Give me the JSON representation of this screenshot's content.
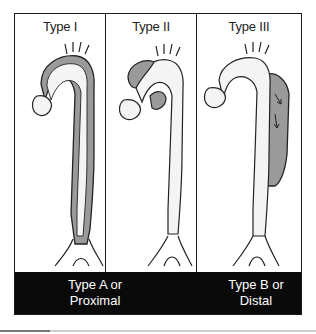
{
  "figure": {
    "panels": [
      {
        "id": "type-1",
        "title": "Type I",
        "dissection_extent": "ascending aorta, arch and descending aorta"
      },
      {
        "id": "type-2",
        "title": "Type II",
        "dissection_extent": "ascending aorta only"
      },
      {
        "id": "type-3",
        "title": "Type III",
        "dissection_extent": "descending aorta only"
      }
    ],
    "classification_labels": [
      {
        "line1": "Type A or",
        "line2": "Proximal",
        "spans": [
          "Type I",
          "Type II"
        ]
      },
      {
        "line1": "Type B or",
        "line2": "Distal",
        "spans": [
          "Type III"
        ]
      }
    ],
    "colors": {
      "frame": "#1a1a1a",
      "band": "#0a0a0a",
      "false_lumen": "#9a9a9a",
      "vessel_fill": "#f4f4f4"
    }
  }
}
